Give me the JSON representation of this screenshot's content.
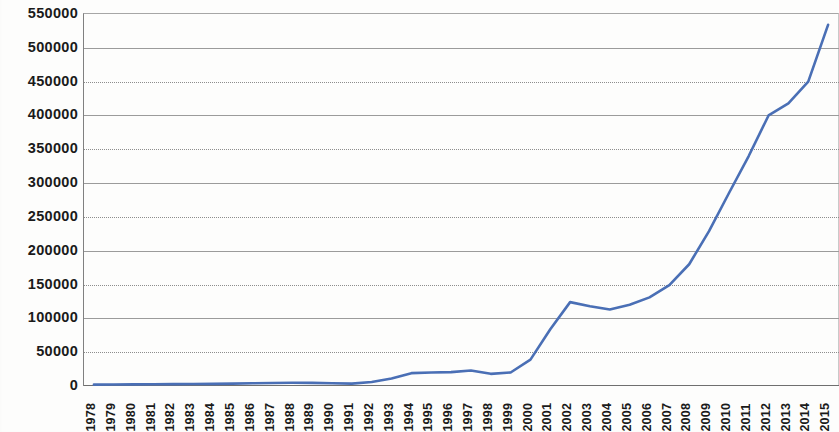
{
  "chart_data": {
    "type": "line",
    "title": "",
    "subtitle": "",
    "xlabel": "",
    "ylabel": "",
    "grid": true,
    "legend": false,
    "legend_position": "none",
    "line_color": "#4a6fb5",
    "ylim": [
      0,
      550000
    ],
    "ytick_step": 50000,
    "yticks": [
      "550000",
      "500000",
      "450000",
      "400000",
      "350000",
      "300000",
      "250000",
      "200000",
      "150000",
      "100000",
      "50000",
      "0"
    ],
    "ytick_values": [
      550000,
      500000,
      450000,
      400000,
      350000,
      300000,
      250000,
      200000,
      150000,
      100000,
      50000,
      0
    ],
    "categories": [
      "1978",
      "1979",
      "1980",
      "1981",
      "1982",
      "1983",
      "1984",
      "1985",
      "1986",
      "1987",
      "1988",
      "1989",
      "1990",
      "1991",
      "1992",
      "1993",
      "1994",
      "1995",
      "1996",
      "1997",
      "1998",
      "1999",
      "2000",
      "2001",
      "2002",
      "2003",
      "2004",
      "2005",
      "2006",
      "2007",
      "2008",
      "2009",
      "2010",
      "2011",
      "2012",
      "2013",
      "2014",
      "2015"
    ],
    "values": [
      2000,
      2200,
      2400,
      2600,
      2800,
      3000,
      3200,
      3500,
      4000,
      4500,
      4800,
      4600,
      4000,
      3500,
      6000,
      11000,
      19000,
      20000,
      20500,
      23000,
      18000,
      20000,
      39000,
      84000,
      124000,
      118000,
      113000,
      120000,
      131000,
      149000,
      180000,
      229000,
      285000,
      340000,
      400000,
      418000,
      450000,
      534000
    ]
  }
}
